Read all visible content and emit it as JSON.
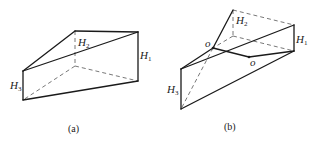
{
  "figures": [
    {
      "id": "a",
      "caption": "(a)",
      "labels": {
        "H1": "H",
        "H1_sub": "1",
        "H2": "H",
        "H2_sub": "2",
        "H3": "H",
        "H3_sub": "3"
      },
      "description": "Triangular prism with vertical edges H1, H2, H3; top face slanted"
    },
    {
      "id": "b",
      "caption": "(b)",
      "labels": {
        "H1": "H",
        "H1_sub": "1",
        "H2": "H",
        "H2_sub": "2",
        "H3": "H",
        "H3_sub": "3",
        "o1": "o",
        "o2": "o"
      },
      "description": "Twisted prism: top surface crosses the base along a line through points o"
    }
  ]
}
